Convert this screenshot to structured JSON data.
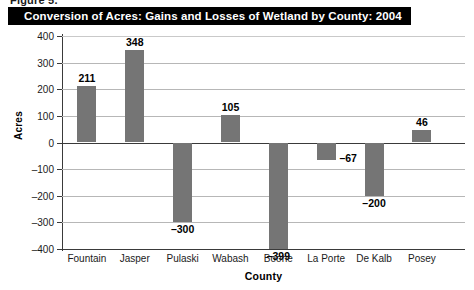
{
  "figure": {
    "label": "Figure 5."
  },
  "title": {
    "text": "Conversion of Acres: Gains and Losses of Wetland by County: 2004"
  },
  "colors": {
    "bar": "#757575",
    "title_bar_bg": "#000000",
    "title_text": "#ffffff",
    "gridline": "#b7b7b7",
    "axis": "#3a3a3a"
  },
  "chart_data": {
    "type": "bar",
    "title": "Conversion of Acres: Gains and Losses of Wetland by County: 2004",
    "xlabel": "County",
    "ylabel": "Acres",
    "categories": [
      "Fountain",
      "Jasper",
      "Pulaski",
      "Wabash",
      "Boone",
      "La Porte",
      "De Kalb",
      "Posey"
    ],
    "values": [
      211,
      348,
      -300,
      105,
      -399,
      -67,
      -200,
      46
    ],
    "value_labels": [
      "211",
      "348",
      "–300",
      "105",
      "–399",
      "–67",
      "–200",
      "46"
    ],
    "ylim": [
      -400,
      400
    ],
    "ytick_values": [
      400,
      300,
      200,
      100,
      0,
      -100,
      -200,
      -300,
      -400
    ],
    "ytick_labels": [
      "400",
      "300",
      "200",
      "100",
      "0",
      "–100",
      "–200",
      "–300",
      "–400"
    ],
    "grid": true,
    "legend": "none"
  }
}
